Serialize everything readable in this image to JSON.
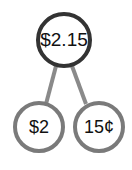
{
  "diagram": {
    "type": "number-bond",
    "whole": {
      "label": "$2.15",
      "stroke": "#333333"
    },
    "parts": [
      {
        "label": "$2",
        "stroke": "#7a7a7a"
      },
      {
        "label": "15¢",
        "stroke": "#7a7a7a"
      }
    ],
    "connector_color": "#8a8a8a"
  }
}
